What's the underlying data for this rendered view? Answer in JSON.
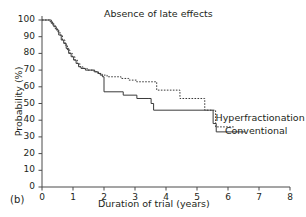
{
  "panel": {
    "label": "(b)"
  },
  "chart_data": {
    "type": "line",
    "title": "Absence of late effects",
    "xlabel": "Duration of trial (years)",
    "ylabel": "Probability (%)",
    "xlim": [
      0,
      8
    ],
    "ylim": [
      0,
      100
    ],
    "xticks": [
      0,
      1,
      2,
      3,
      4,
      5,
      6,
      7,
      8
    ],
    "xtick_labels": [
      "0",
      "1",
      "2",
      "3",
      "4",
      "5",
      "6",
      "7",
      "8"
    ],
    "yticks": [
      0,
      10,
      20,
      30,
      40,
      50,
      60,
      70,
      80,
      90,
      100
    ],
    "ytick_labels": [
      "0",
      "10",
      "20",
      "30",
      "40",
      "50",
      "60",
      "70",
      "80",
      "90",
      "100"
    ],
    "grid": false,
    "legend_position": "inline-right",
    "style": "kaplan-meier-step",
    "series": [
      {
        "name": "Hyperfractionation",
        "linestyle": "dotted",
        "color": "#3a3a3a",
        "label_x": 5.6,
        "label_y": 41,
        "points": [
          [
            0.0,
            100
          ],
          [
            0.18,
            100
          ],
          [
            0.26,
            99
          ],
          [
            0.34,
            97
          ],
          [
            0.42,
            95
          ],
          [
            0.5,
            93
          ],
          [
            0.58,
            91
          ],
          [
            0.66,
            88
          ],
          [
            0.74,
            85
          ],
          [
            0.82,
            82
          ],
          [
            0.9,
            80
          ],
          [
            0.98,
            78
          ],
          [
            1.06,
            76
          ],
          [
            1.14,
            74
          ],
          [
            1.22,
            72
          ],
          [
            1.32,
            71
          ],
          [
            1.46,
            70
          ],
          [
            1.58,
            70
          ],
          [
            1.7,
            69
          ],
          [
            1.82,
            68
          ],
          [
            1.94,
            67
          ],
          [
            2.1,
            66
          ],
          [
            2.35,
            66
          ],
          [
            2.55,
            65
          ],
          [
            2.8,
            64
          ],
          [
            3.05,
            63
          ],
          [
            3.55,
            63
          ],
          [
            3.7,
            58
          ],
          [
            4.3,
            58
          ],
          [
            4.45,
            53
          ],
          [
            5.1,
            53
          ],
          [
            5.25,
            46
          ],
          [
            5.5,
            46
          ],
          [
            5.6,
            36
          ],
          [
            6.2,
            36
          ]
        ]
      },
      {
        "name": "Conventional",
        "linestyle": "solid",
        "color": "#3a3a3a",
        "label_x": 5.9,
        "label_y": 33,
        "points": [
          [
            0.0,
            100
          ],
          [
            0.22,
            100
          ],
          [
            0.3,
            98
          ],
          [
            0.38,
            96
          ],
          [
            0.46,
            94
          ],
          [
            0.54,
            91
          ],
          [
            0.62,
            88
          ],
          [
            0.7,
            86
          ],
          [
            0.78,
            83
          ],
          [
            0.86,
            80
          ],
          [
            0.94,
            78
          ],
          [
            1.02,
            76
          ],
          [
            1.1,
            74
          ],
          [
            1.18,
            72
          ],
          [
            1.26,
            71
          ],
          [
            1.4,
            70
          ],
          [
            1.55,
            70
          ],
          [
            1.68,
            69
          ],
          [
            1.8,
            68
          ],
          [
            1.88,
            67
          ],
          [
            1.95,
            66
          ],
          [
            2.0,
            57
          ],
          [
            2.55,
            57
          ],
          [
            2.62,
            55
          ],
          [
            3.0,
            55
          ],
          [
            3.06,
            53
          ],
          [
            3.45,
            53
          ],
          [
            3.52,
            50
          ],
          [
            3.6,
            46
          ],
          [
            5.4,
            46
          ],
          [
            5.52,
            38
          ],
          [
            5.62,
            33
          ],
          [
            6.55,
            33
          ]
        ]
      }
    ]
  }
}
